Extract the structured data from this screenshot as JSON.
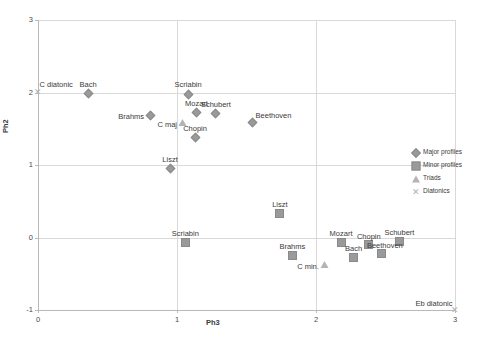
{
  "chart_data": {
    "type": "scatter",
    "title": "",
    "xlabel": "Ph3",
    "ylabel": "Ph2",
    "xlim": [
      0,
      3
    ],
    "ylim": [
      -1,
      3
    ],
    "xticks": [
      "0",
      "1",
      "2",
      "3"
    ],
    "yticks": [
      "-1",
      "0",
      "1",
      "2",
      "3"
    ],
    "grid": true,
    "legend_position": "right",
    "legend": [
      {
        "name": "Major profiles",
        "marker": "diamond-marker"
      },
      {
        "name": "Minor profiles",
        "marker": "square-marker"
      },
      {
        "name": "Triads",
        "marker": "triangle-marker"
      },
      {
        "name": "Diatonics",
        "marker": "cross-marker"
      }
    ],
    "series": [
      {
        "name": "Major profiles",
        "marker": "diamond-marker",
        "points": [
          {
            "label": "Bach",
            "x": 0.36,
            "y": 1.98
          },
          {
            "label": "Scriabin",
            "x": 1.08,
            "y": 1.97
          },
          {
            "label": "Brahms",
            "x": 0.81,
            "y": 1.68
          },
          {
            "label": "Mozart",
            "x": 1.14,
            "y": 1.72
          },
          {
            "label": "Schubert",
            "x": 1.28,
            "y": 1.71
          },
          {
            "label": "Beethoven",
            "x": 1.54,
            "y": 1.58
          },
          {
            "label": "Chopin",
            "x": 1.13,
            "y": 1.38
          },
          {
            "label": "Liszt",
            "x": 0.95,
            "y": 0.95
          }
        ]
      },
      {
        "name": "Minor profiles",
        "marker": "square-marker",
        "points": [
          {
            "label": "Liszt",
            "x": 1.74,
            "y": 0.33
          },
          {
            "label": "Scriabin",
            "x": 1.06,
            "y": -0.07
          },
          {
            "label": "Mozart",
            "x": 2.18,
            "y": -0.07
          },
          {
            "label": "Chopin",
            "x": 2.38,
            "y": -0.1
          },
          {
            "label": "Schubert",
            "x": 2.6,
            "y": -0.06
          },
          {
            "label": "Beethoven",
            "x": 2.47,
            "y": -0.22
          },
          {
            "label": "Brahms",
            "x": 1.83,
            "y": -0.25
          },
          {
            "label": "Bach",
            "x": 2.27,
            "y": -0.28
          }
        ]
      },
      {
        "name": "Triads",
        "marker": "triangle-marker",
        "points": [
          {
            "label": "C maj",
            "x": 1.04,
            "y": 1.58
          },
          {
            "label": "C min.",
            "x": 2.06,
            "y": -0.37
          }
        ]
      },
      {
        "name": "Diatonics",
        "marker": "cross-marker",
        "points": [
          {
            "label": "C diatonic",
            "x": 0.0,
            "y": 2.0
          },
          {
            "label": "Eb diatonic",
            "x": 3.0,
            "y": -1.0
          }
        ]
      }
    ]
  },
  "colors": {
    "marker": "#9a9a9a",
    "triad_marker": "#b4b4b4",
    "diatonic_marker": "#b0b0b0",
    "gridline": "#d9d9d9",
    "axis": "#b9b9b9",
    "text": "#3a3a3a"
  }
}
